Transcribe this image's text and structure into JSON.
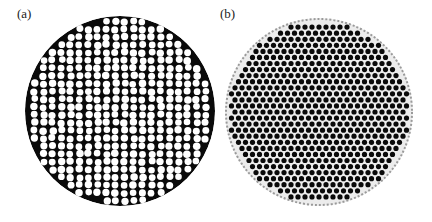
{
  "figure": {
    "panels": [
      {
        "label": "(a)",
        "description": "Circular region of a disordered hexagonal lattice: white cells with thick black walls",
        "center": [
          120,
          111
        ],
        "radius": 95,
        "cell_spacing": 9,
        "cell_color": "#ffffff",
        "wall_color": "#0a0a0a"
      },
      {
        "label": "(b)",
        "description": "Circular region of an ordered hexagonal lattice: black dots on light background",
        "center": [
          103,
          112
        ],
        "radius": 94,
        "cell_spacing": 7,
        "dot_color": "#0a0a0a",
        "background_color": "#e8e8e8"
      }
    ]
  }
}
